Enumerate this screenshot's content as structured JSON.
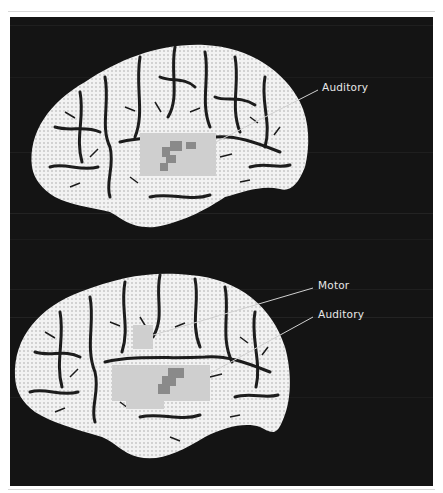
{
  "figure": {
    "colors": {
      "background": "#141414",
      "cortex": "#f2f2f2",
      "sulci": "#1c1c1c",
      "activation_light": "#cfcfcf",
      "activation_dark": "#8a8a8a",
      "leader_line": "#d0d0d0",
      "label_text": "#e8e8e8"
    },
    "panels": [
      {
        "id": "top",
        "labels": [
          {
            "text": "Auditory",
            "region": "auditory"
          }
        ]
      },
      {
        "id": "bottom",
        "labels": [
          {
            "text": "Motor",
            "region": "motor"
          },
          {
            "text": "Auditory",
            "region": "auditory"
          }
        ]
      }
    ]
  }
}
